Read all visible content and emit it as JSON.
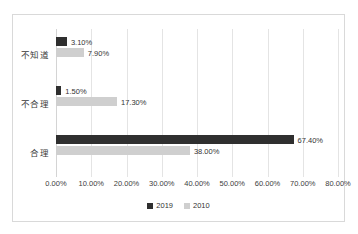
{
  "chart_data": {
    "type": "bar",
    "orientation": "horizontal",
    "title": "",
    "xlabel": "",
    "ylabel": "",
    "categories": [
      "不知道",
      "不合理",
      "合理"
    ],
    "series": [
      {
        "name": "2019",
        "color": "#2f2f2f",
        "values": [
          3.1,
          1.5,
          67.4
        ],
        "labels": [
          "3.10%",
          "1.50%",
          "67.40%"
        ]
      },
      {
        "name": "2010",
        "color": "#cfcfcf",
        "values": [
          7.9,
          17.3,
          38.0
        ],
        "labels": [
          "7.90%",
          "17.30%",
          "38.00%"
        ]
      }
    ],
    "xlim": [
      0,
      80
    ],
    "xticks": [
      0,
      10,
      20,
      30,
      40,
      50,
      60,
      70,
      80
    ],
    "xtick_labels": [
      "0.00%",
      "10.00%",
      "20.00%",
      "30.00%",
      "40.00%",
      "50.00%",
      "60.00%",
      "70.00%",
      "80.00%"
    ],
    "grid": true,
    "grid_axis": "x",
    "legend_position": "bottom",
    "legend_entries": [
      "2019",
      "2010"
    ],
    "plot_border_color": "#d9d9d9",
    "gridline_color": "#e4e4e4",
    "background_color": "#ffffff"
  }
}
